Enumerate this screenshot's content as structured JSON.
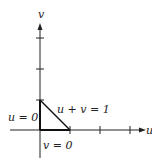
{
  "diagram": {
    "axes": {
      "horizontal_label": "u",
      "vertical_label": "v"
    },
    "boundary_labels": {
      "u_zero": "u = 0",
      "v_zero": "v = 0",
      "hypotenuse": "u + v = 1"
    },
    "region": {
      "shape": "triangle",
      "vertices": [
        [
          0,
          0
        ],
        [
          1,
          0
        ],
        [
          0,
          1
        ]
      ]
    },
    "ticks": {
      "u": [
        1,
        2,
        3
      ],
      "v": [
        1,
        2,
        3
      ]
    },
    "colors": {
      "line": "#222222",
      "background": "#ffffff"
    }
  }
}
